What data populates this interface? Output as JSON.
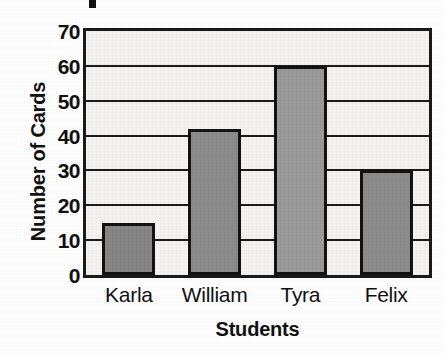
{
  "figure": {
    "title_fragment_visible": true,
    "background_color": "#ffffff",
    "plot_background_color": "#f3f2f0",
    "axis_color": "#1a1a1a"
  },
  "chart_data": {
    "type": "bar",
    "title": "",
    "xlabel": "Students",
    "ylabel": "Number of Cards",
    "categories": [
      "Karla",
      "William",
      "Tyra",
      "Felix"
    ],
    "values": [
      15,
      42,
      60,
      30
    ],
    "bar_colors": [
      "#858585",
      "#8b8b8b",
      "#9a9a9a",
      "#8b8b8b"
    ],
    "bar_edge_color": "#131313",
    "ylim": [
      0,
      70
    ],
    "ytick_labels": [
      "0",
      "10",
      "20",
      "30",
      "40",
      "50",
      "60",
      "70"
    ],
    "ytick_values": [
      0,
      10,
      20,
      30,
      40,
      50,
      60,
      70
    ],
    "grid": "horizontal",
    "legend": "none"
  }
}
